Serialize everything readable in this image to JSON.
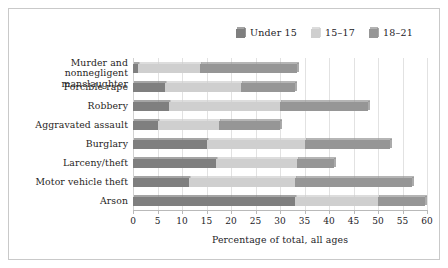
{
  "chart_data": {
    "type": "bar",
    "orientation": "horizontal",
    "stacked": true,
    "title": "",
    "xlabel": "Percentage of total, all ages",
    "ylabel": "",
    "xlim": [
      0,
      60
    ],
    "xticks": [
      0,
      5,
      10,
      15,
      20,
      25,
      30,
      35,
      40,
      45,
      50,
      55,
      60
    ],
    "grid": true,
    "grid_axis": "x",
    "legend_position": "top-right",
    "categories": [
      "Murder and nonnegligent manslaughter",
      "Forcible rape",
      "Robbery",
      "Aggravated assault",
      "Burglary",
      "Larceny/theft",
      "Motor vehicle theft",
      "Arson"
    ],
    "series": [
      {
        "name": "Under 15",
        "color": "#7f7f7f",
        "values": [
          1.0,
          6.5,
          7.3,
          5.0,
          15.0,
          17.0,
          11.5,
          33.0
        ]
      },
      {
        "name": "15-17",
        "color": "#cfcfcf",
        "values": [
          12.7,
          15.5,
          22.7,
          12.5,
          20.0,
          16.5,
          21.5,
          17.0
        ]
      },
      {
        "name": "18-21",
        "color": "#969696",
        "values": [
          19.8,
          11.0,
          18.0,
          12.5,
          17.5,
          7.5,
          24.0,
          9.5
        ]
      }
    ],
    "cumulative_totals": [
      33.5,
      33.0,
      48.0,
      30.0,
      52.5,
      41.0,
      57.0,
      59.5
    ]
  },
  "legend": {
    "items": [
      {
        "label": "Under 15",
        "color": "#7f7f7f",
        "swatch": "cube-icon"
      },
      {
        "label": "15–17",
        "color": "#cfcfcf",
        "swatch": "cube-icon"
      },
      {
        "label": "18–21",
        "color": "#969696",
        "swatch": "cube-icon"
      }
    ]
  },
  "axis": {
    "x_title": "Percentage of total, all ages",
    "x_tick_labels": [
      "0",
      "5",
      "10",
      "15",
      "20",
      "25",
      "30",
      "35",
      "40",
      "45",
      "50",
      "55",
      "60"
    ]
  },
  "category_labels": [
    {
      "line1": "Murder and nonnegligent",
      "line2": "manslaughter"
    },
    {
      "line1": "Forcible rape",
      "line2": ""
    },
    {
      "line1": "Robbery",
      "line2": ""
    },
    {
      "line1": "Aggravated assault",
      "line2": ""
    },
    {
      "line1": "Burglary",
      "line2": ""
    },
    {
      "line1": "Larceny/theft",
      "line2": ""
    },
    {
      "line1": "Motor vehicle theft",
      "line2": ""
    },
    {
      "line1": "Arson",
      "line2": ""
    }
  ],
  "colors": {
    "under15": "#7f7f7f",
    "age15_17": "#cfcfcf",
    "age18_21": "#969696",
    "grid": "#e2e2e2",
    "frame": "#c9c9c9",
    "text": "#23221f",
    "background": "#ffffff"
  }
}
